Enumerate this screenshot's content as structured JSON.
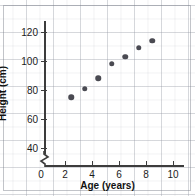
{
  "chart_data": {
    "type": "scatter",
    "title": "",
    "xlabel": "Age (years)",
    "ylabel": "Height (cm)",
    "x": [
      2,
      3,
      4,
      5,
      6,
      7,
      8
    ],
    "values": [
      75,
      81,
      88,
      98,
      103,
      109,
      114
    ],
    "points": [
      {
        "x": 2,
        "y": 75
      },
      {
        "x": 3,
        "y": 81
      },
      {
        "x": 4,
        "y": 88
      },
      {
        "x": 5,
        "y": 98
      },
      {
        "x": 6,
        "y": 103
      },
      {
        "x": 7,
        "y": 109
      },
      {
        "x": 8,
        "y": 114
      }
    ],
    "xlim": [
      0,
      11
    ],
    "ylim": [
      30,
      128
    ],
    "x_ticks": [
      0,
      2,
      4,
      6,
      8,
      10
    ],
    "x_tick_labels": [
      "0",
      "2",
      "4",
      "6",
      "8",
      "10"
    ],
    "y_ticks": [
      40,
      60,
      80,
      100,
      120
    ],
    "y_tick_labels": [
      "40",
      "60",
      "80",
      "100",
      "120"
    ],
    "grid": true,
    "legend": "none",
    "y_axis_break": true,
    "marker_color": "#4a4a52",
    "axis_color": "#3c3c3c",
    "grid_color": "#969ba5"
  },
  "axes": {
    "x_title": "Age (years)",
    "y_title": "Height (cm)"
  },
  "ticks": {
    "x": [
      "0",
      "2",
      "4",
      "6",
      "8",
      "10"
    ],
    "y": [
      "40",
      "60",
      "80",
      "100",
      "120"
    ]
  }
}
